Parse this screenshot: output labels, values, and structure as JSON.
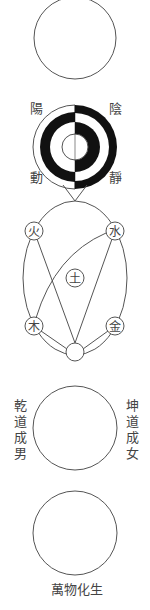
{
  "diagram": {
    "stroke_color": "#555555",
    "fill_dark": "#111111",
    "yinyang": {
      "labels": {
        "top_left": "陽",
        "top_right": "陰",
        "bottom_left": "動",
        "bottom_right": "靜"
      }
    },
    "five_phases": {
      "nodes": [
        {
          "id": "fire",
          "label": "火"
        },
        {
          "id": "water",
          "label": "水"
        },
        {
          "id": "earth",
          "label": "土"
        },
        {
          "id": "wood",
          "label": "木"
        },
        {
          "id": "metal",
          "label": "金"
        }
      ]
    },
    "qiankun": {
      "left_label": "乾道成男",
      "right_label": "坤道成女"
    },
    "wanwu": {
      "label": "萬物化生"
    }
  }
}
